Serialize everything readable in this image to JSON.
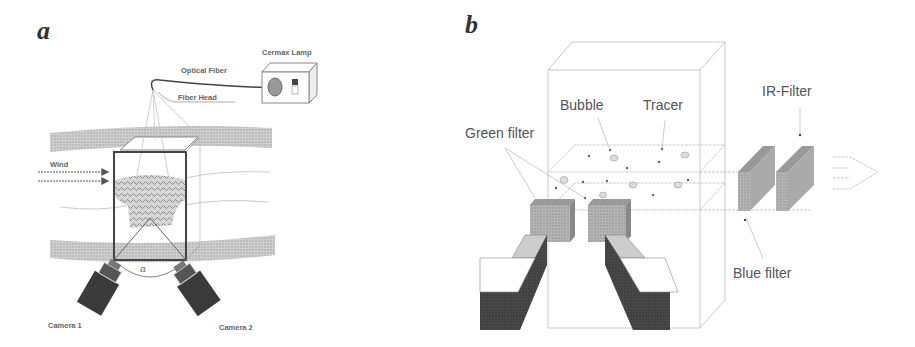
{
  "panel_a": {
    "label": "a",
    "labels": {
      "cermax_lamp": "Cermax Lamp",
      "optical_fiber": "Optical Fiber",
      "fiber_head": "Fiber Head",
      "wind": "Wind",
      "alpha": "α",
      "camera_1": "Camera 1",
      "camera_2": "Camera 2"
    }
  },
  "panel_b": {
    "label": "b",
    "labels": {
      "bubble": "Bubble",
      "tracer": "Tracer",
      "green_filter": "Green filter",
      "ir_filter": "IR-Filter",
      "blue_filter": "Blue filter"
    }
  },
  "colors": {
    "band_gray": "#c8c8c8",
    "dark_box": "#444444",
    "camera_dark": "#3a3a3a",
    "filter_gray": "#a8a8a8",
    "line_light": "#bbbbbb"
  }
}
